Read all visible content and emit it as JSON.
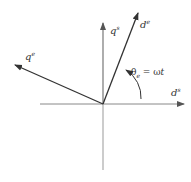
{
  "diagram": {
    "type": "reference-frame-vector-diagram",
    "axes": {
      "q_s": {
        "base": "q",
        "sup": "s"
      },
      "d_s": {
        "base": "d",
        "sup": "s"
      },
      "d_e": {
        "base": "d",
        "sup": "e"
      },
      "q_e": {
        "base": "q",
        "sup": "e"
      }
    },
    "angle": {
      "symbol": "θ",
      "sub": "e",
      "eq": " = ω",
      "var": "t"
    },
    "colors": {
      "stationary_axes": "#888888",
      "rotating_axes": "#333333"
    }
  }
}
